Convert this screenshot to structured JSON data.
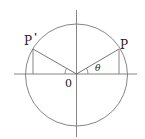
{
  "diagram": {
    "type": "unit-circle-reflection",
    "labels": {
      "point_p": "P",
      "point_p_prime_letter": "P",
      "point_p_prime_mark": "'",
      "origin": "0",
      "angle": "θ"
    },
    "colors": {
      "stroke": "#666666",
      "text": "#222222",
      "background": "#ffffff"
    }
  }
}
